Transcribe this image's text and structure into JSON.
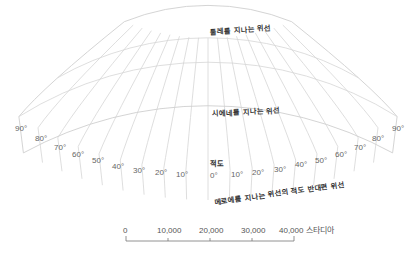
{
  "diagram": {
    "type": "map-projection-grid",
    "colors": {
      "grid": "#d6d6d6",
      "label": "#333333",
      "degree": "#666666",
      "scale": "#777777"
    },
    "parallels": [
      {
        "id": "thule",
        "label": "툴레를 지나는 위선"
      },
      {
        "id": "syene",
        "label": "시에네를 지나는 위선"
      },
      {
        "id": "equator",
        "label": "적도"
      },
      {
        "id": "anti-meroe",
        "label": "메로에를 지나는 위선의 적도 반대편 위선"
      }
    ],
    "longitude_labels_left": [
      "90°",
      "80°",
      "70°",
      "60°",
      "50°",
      "40°",
      "30°",
      "20°",
      "10°"
    ],
    "center_label": "0°",
    "longitude_labels_right": [
      "10°",
      "20°",
      "30°",
      "40°",
      "50°",
      "60°",
      "70°",
      "80°",
      "90°"
    ],
    "scale_bar": {
      "ticks": [
        "0",
        "10,000",
        "20,000",
        "30,000",
        "40,000"
      ],
      "unit": "스타디아"
    }
  }
}
